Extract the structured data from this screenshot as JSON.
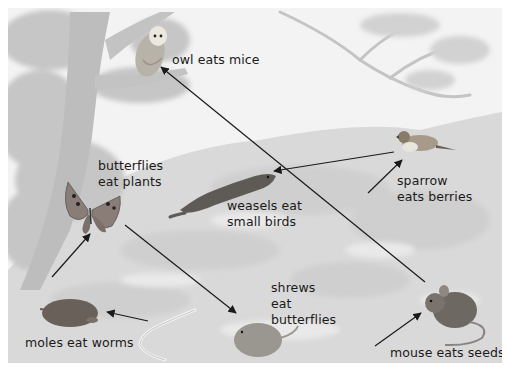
{
  "diagram": {
    "type": "food-web",
    "style": "greyscale illustration",
    "colors": {
      "background": "#f2f2f2",
      "foliage": "#c8c8c8",
      "ground": "#d6d6d6",
      "arrow": "#1a1a1a",
      "text": "#1a1a1a"
    },
    "nodes": [
      {
        "id": "owl",
        "icon": "owl-icon",
        "label": "owl eats mice"
      },
      {
        "id": "butterfly",
        "icon": "butterfly-icon",
        "label_line1": "butterflies",
        "label_line2": "eat plants"
      },
      {
        "id": "weasel",
        "icon": "weasel-icon",
        "label_line1": "weasels eat",
        "label_line2": "small birds"
      },
      {
        "id": "sparrow",
        "icon": "sparrow-icon",
        "label_line1": "sparrow",
        "label_line2": "eats berries"
      },
      {
        "id": "shrew",
        "icon": "shrew-icon",
        "label_line1": "shrews",
        "label_line2": "eat",
        "label_line3": "butterflies"
      },
      {
        "id": "mole",
        "icon": "mole-icon",
        "label": "moles eat worms"
      },
      {
        "id": "worm",
        "icon": "worm-icon"
      },
      {
        "id": "mouse",
        "icon": "mouse-icon",
        "label": "mouse eats seeds"
      }
    ],
    "edges": [
      {
        "from": "mouse",
        "to": "owl"
      },
      {
        "from": "sparrow",
        "to": "weasel"
      },
      {
        "from": "berries",
        "to": "sparrow"
      },
      {
        "from": "plants",
        "to": "butterfly"
      },
      {
        "from": "butterfly",
        "to": "shrew"
      },
      {
        "from": "worm",
        "to": "mole"
      },
      {
        "from": "seeds",
        "to": "mouse"
      }
    ]
  }
}
